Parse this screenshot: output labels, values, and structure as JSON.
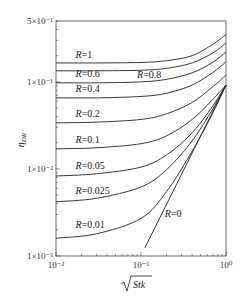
{
  "chart_data": {
    "type": "line",
    "title": "",
    "xlabel": "√Stk",
    "ylabel": "η_DR",
    "xscale": "log",
    "yscale": "log",
    "xlim": [
      0.01,
      1
    ],
    "ylim": [
      0.001,
      0.5
    ],
    "grid": false,
    "legend": "inline labels",
    "x_ticks": [
      {
        "value": 0.01,
        "label": "10⁻²"
      },
      {
        "value": 0.1,
        "label": "10⁻¹"
      },
      {
        "value": 1,
        "label": "10⁰"
      }
    ],
    "y_ticks": [
      {
        "value": 0.001,
        "label": "1×10⁻³"
      },
      {
        "value": 0.01,
        "label": "1×10⁻²"
      },
      {
        "value": 0.1,
        "label": "1×10⁻¹"
      },
      {
        "value": 0.5,
        "label": "5×10⁻¹"
      }
    ],
    "series": [
      {
        "name": "R=1",
        "x": [
          0.01,
          0.03,
          0.1,
          0.2,
          0.4,
          0.7,
          1.0
        ],
        "y": [
          0.165,
          0.165,
          0.167,
          0.175,
          0.2,
          0.27,
          0.35
        ]
      },
      {
        "name": "R=0.8",
        "x": [
          0.01,
          0.03,
          0.1,
          0.2,
          0.4,
          0.7,
          1.0
        ],
        "y": [
          0.134,
          0.134,
          0.136,
          0.143,
          0.165,
          0.215,
          0.28
        ]
      },
      {
        "name": "R=0.6",
        "x": [
          0.01,
          0.03,
          0.1,
          0.2,
          0.4,
          0.7,
          1.0
        ],
        "y": [
          0.0975,
          0.0975,
          0.1,
          0.107,
          0.127,
          0.168,
          0.22
        ]
      },
      {
        "name": "R=0.4",
        "x": [
          0.01,
          0.03,
          0.1,
          0.2,
          0.4,
          0.7,
          1.0
        ],
        "y": [
          0.0655,
          0.0655,
          0.068,
          0.074,
          0.092,
          0.128,
          0.17
        ]
      },
      {
        "name": "R=0.2",
        "x": [
          0.01,
          0.03,
          0.1,
          0.2,
          0.4,
          0.7,
          1.0
        ],
        "y": [
          0.0338,
          0.0345,
          0.037,
          0.043,
          0.058,
          0.088,
          0.12
        ]
      },
      {
        "name": "R=0.1",
        "x": [
          0.01,
          0.03,
          0.1,
          0.2,
          0.4,
          0.7,
          1.0
        ],
        "y": [
          0.017,
          0.0175,
          0.0195,
          0.024,
          0.037,
          0.063,
          0.092
        ]
      },
      {
        "name": "R=0.05",
        "x": [
          0.01,
          0.03,
          0.1,
          0.2,
          0.4,
          0.7,
          1.0
        ],
        "y": [
          0.0083,
          0.0088,
          0.0105,
          0.0145,
          0.026,
          0.053,
          0.092
        ]
      },
      {
        "name": "R=0.025",
        "x": [
          0.01,
          0.03,
          0.1,
          0.2,
          0.4,
          0.7,
          1.0
        ],
        "y": [
          0.0042,
          0.0046,
          0.0062,
          0.0098,
          0.021,
          0.049,
          0.092
        ]
      },
      {
        "name": "R=0.01",
        "x": [
          0.01,
          0.03,
          0.1,
          0.2,
          0.4,
          0.7,
          1.0
        ],
        "y": [
          0.0016,
          0.0018,
          0.0027,
          0.0055,
          0.016,
          0.044,
          0.092
        ]
      },
      {
        "name": "R=0",
        "x": [
          0.111,
          1.0
        ],
        "y": [
          0.00124,
          0.092
        ]
      }
    ],
    "annotations": [
      {
        "text": "R=1",
        "x": 0.017,
        "y": 0.19
      },
      {
        "text": "R=0.8",
        "x": 0.09,
        "y": 0.112
      },
      {
        "text": "R=0.6",
        "x": 0.017,
        "y": 0.113
      },
      {
        "text": "R=0.4",
        "x": 0.017,
        "y": 0.076
      },
      {
        "text": "R=0.2",
        "x": 0.017,
        "y": 0.04
      },
      {
        "text": "R=0.1",
        "x": 0.017,
        "y": 0.02
      },
      {
        "text": "R=0.05",
        "x": 0.017,
        "y": 0.01
      },
      {
        "text": "R=0.025",
        "x": 0.017,
        "y": 0.0051
      },
      {
        "text": "R=0.01",
        "x": 0.017,
        "y": 0.0021
      },
      {
        "text": "R=0",
        "x": 0.19,
        "y": 0.0028
      }
    ]
  },
  "axes": {
    "y_label_main": "η",
    "y_label_sub": "DR",
    "x_label": "Stk"
  }
}
